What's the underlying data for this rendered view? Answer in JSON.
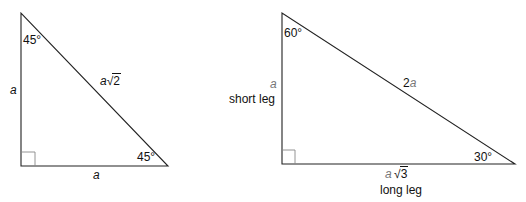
{
  "triangle_45": {
    "angles": {
      "top": "45°",
      "bottom_right": "45°"
    },
    "sides": {
      "left_leg": "a",
      "bottom_leg": "a",
      "hypotenuse_coef": "a",
      "hypotenuse_radicand": "2"
    },
    "stroke_color": "#222222"
  },
  "triangle_30_60": {
    "angles": {
      "top": "60°",
      "bottom_right": "30°"
    },
    "sides": {
      "short_leg_var": "a",
      "short_leg_label": "short leg",
      "hypotenuse": "2",
      "hypotenuse_var": "a",
      "long_leg_coef": "a",
      "long_leg_radicand": "3",
      "long_leg_label": "long leg"
    },
    "variable_color": "#777777"
  }
}
